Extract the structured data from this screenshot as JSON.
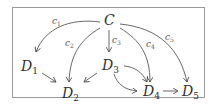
{
  "diagram": {
    "type": "directed-graph",
    "nodes": {
      "C": {
        "name": "C",
        "sub": ""
      },
      "D1": {
        "name": "D",
        "sub": "1"
      },
      "D2": {
        "name": "D",
        "sub": "2"
      },
      "D3": {
        "name": "D",
        "sub": "3"
      },
      "D4": {
        "name": "D",
        "sub": "4"
      },
      "D5": {
        "name": "D",
        "sub": "5"
      }
    },
    "edge_labels": {
      "c1": {
        "name": "c",
        "sub": "1"
      },
      "c2": {
        "name": "c",
        "sub": "2"
      },
      "c3": {
        "name": "c",
        "sub": "3"
      },
      "c4": {
        "name": "c",
        "sub": "4"
      },
      "c5": {
        "name": "c",
        "sub": "5"
      }
    },
    "edges": [
      {
        "from": "C",
        "to": "D1",
        "label": "c1"
      },
      {
        "from": "C",
        "to": "D2",
        "label": "c2"
      },
      {
        "from": "C",
        "to": "D3",
        "label": "c3"
      },
      {
        "from": "C",
        "to": "D4",
        "label": "c4"
      },
      {
        "from": "C",
        "to": "D5",
        "label": "c5"
      },
      {
        "from": "D1",
        "to": "D2",
        "label": ""
      },
      {
        "from": "D3",
        "to": "D2",
        "label": ""
      },
      {
        "from": "D3",
        "to": "D4",
        "label": ""
      },
      {
        "from": "D3",
        "to": "D4",
        "label": ""
      },
      {
        "from": "D4",
        "to": "D5",
        "label": ""
      }
    ],
    "colors": {
      "stroke": "#444444",
      "border": "#9a9a9a"
    }
  }
}
